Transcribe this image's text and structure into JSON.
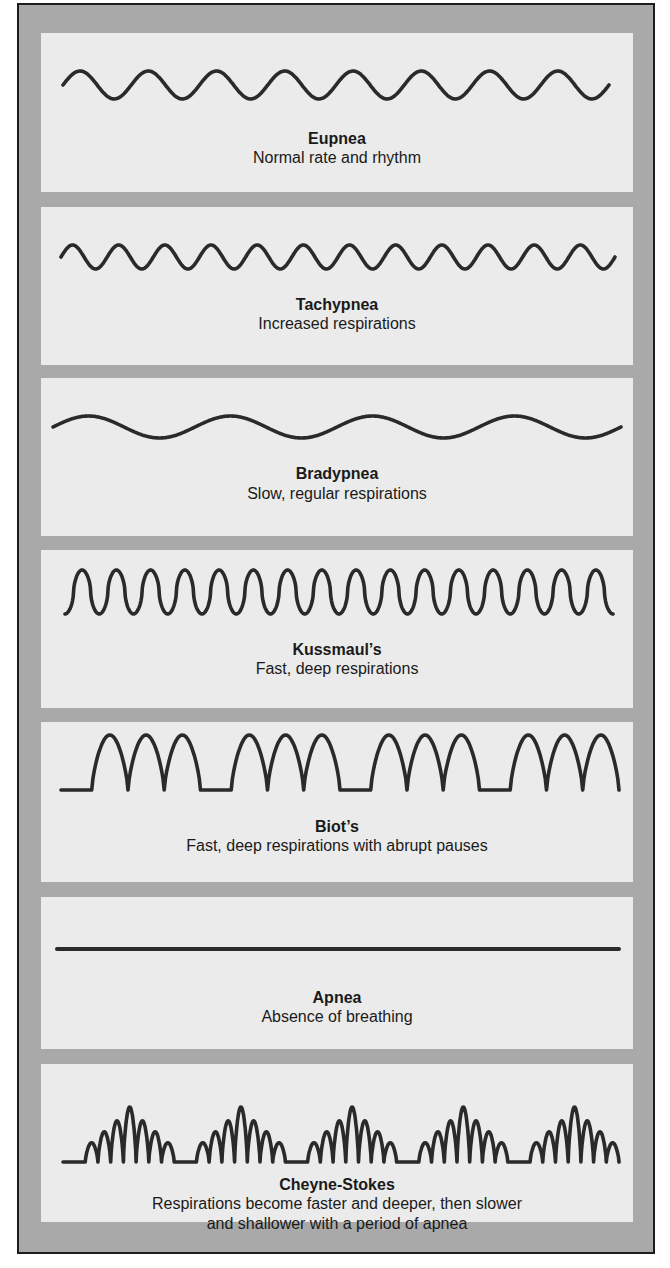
{
  "figure": {
    "colors": {
      "frame": "#a9a9a9",
      "panel": "#ebebeb",
      "stroke": "#2a2a2a",
      "border": "#1c1c1c"
    },
    "patterns": [
      {
        "name": "Eupnea",
        "description": "Normal rate and rhythm",
        "wave": {
          "type": "sine",
          "cycles": 8,
          "amplitude": 14,
          "start_x": 22,
          "end_x": 568
        }
      },
      {
        "name": "Tachypnea",
        "description": "Increased respirations",
        "wave": {
          "type": "sine",
          "cycles": 12,
          "amplitude": 12,
          "start_x": 20,
          "end_x": 574
        }
      },
      {
        "name": "Bradypnea",
        "description": "Slow, regular respirations",
        "wave": {
          "type": "sine",
          "cycles": 4,
          "amplitude": 11,
          "start_x": 12,
          "end_x": 580
        }
      },
      {
        "name": "Kussmaul’s",
        "description": "Fast, deep respirations",
        "wave": {
          "type": "zigzag",
          "cycles": 16,
          "amplitude": 22,
          "start_x": 24,
          "end_x": 572
        }
      },
      {
        "name": "Biot’s",
        "description": "Fast, deep respirations with abrupt pauses",
        "wave": {
          "type": "bursts",
          "groups": 4,
          "peaks_per_group": 3,
          "amplitude": 55,
          "start_x": 20,
          "end_x": 578
        }
      },
      {
        "name": "Apnea",
        "description": "Absence of breathing",
        "wave": {
          "type": "flat",
          "start_x": 16,
          "end_x": 578
        }
      },
      {
        "name": "Cheyne-Stokes",
        "description": "Respirations become faster and deeper, then slower\nand shallower with a period of apnea",
        "wave": {
          "type": "crescendo",
          "groups": 5,
          "peaks_per_group": 7,
          "amplitude": 55,
          "start_x": 22,
          "end_x": 578
        }
      }
    ]
  }
}
